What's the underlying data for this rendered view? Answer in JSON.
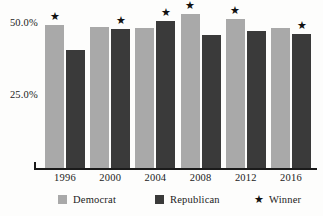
{
  "chart_data": {
    "type": "bar",
    "title": "",
    "subtitle": "",
    "xlabel": "",
    "ylabel": "",
    "categories": [
      "1996",
      "2000",
      "2004",
      "2008",
      "2012",
      "2016"
    ],
    "series": [
      {
        "name": "Democrat",
        "color": "#a9a9a9",
        "values": [
          49.2,
          48.4,
          48.3,
          52.9,
          51.1,
          48.2
        ]
      },
      {
        "name": "Republican",
        "color": "#3a3a3a",
        "values": [
          40.7,
          47.9,
          50.7,
          45.7,
          47.2,
          46.1
        ]
      }
    ],
    "winners": [
      "Democrat",
      "Republican",
      "Republican",
      "Democrat",
      "Democrat",
      "Republican"
    ],
    "winner_marker": "★",
    "ylim": [
      0,
      55
    ],
    "yticks": [
      25.0,
      50.0
    ],
    "ytick_labels": [
      "25.0%",
      "50.0%"
    ],
    "grid": false,
    "legend_position": "bottom"
  },
  "axis": {
    "y_labels": [
      {
        "text": "50.0%",
        "value": 50.0
      },
      {
        "text": "25.0%",
        "value": 25.0
      }
    ],
    "x_labels": [
      "1996",
      "2000",
      "2004",
      "2008",
      "2012",
      "2016"
    ]
  },
  "legend": {
    "items": [
      {
        "label": "Democrat",
        "marker": "swatch",
        "color": "#a9a9a9"
      },
      {
        "label": "Republican",
        "marker": "swatch",
        "color": "#3a3a3a"
      },
      {
        "label": "Winner",
        "marker": "star",
        "glyph": "★"
      }
    ]
  }
}
